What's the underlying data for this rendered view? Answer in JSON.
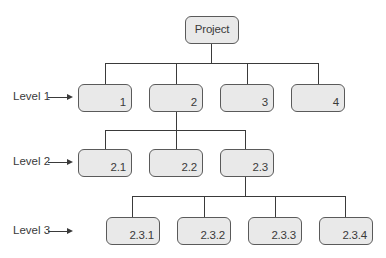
{
  "diagram": {
    "type": "work-breakdown-structure",
    "root": {
      "label": "Project"
    },
    "levels": [
      {
        "label": "Level 1",
        "nodes": [
          "1",
          "2",
          "3",
          "4"
        ]
      },
      {
        "label": "Level 2",
        "parent": "2",
        "nodes": [
          "2.1",
          "2.2",
          "2.3"
        ]
      },
      {
        "label": "Level 3",
        "parent": "2.3",
        "nodes": [
          "2.3.1",
          "2.3.2",
          "2.3.3",
          "2.3.4"
        ]
      }
    ],
    "colors": {
      "node_fill": "#e9e9e9",
      "node_border": "#5a5a5a",
      "line": "#3a3a3a"
    }
  }
}
